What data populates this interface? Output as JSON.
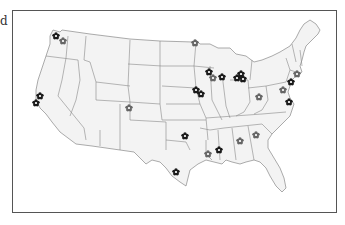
{
  "cut_label": "d",
  "map": {
    "region": "United States (contiguous)",
    "land_color": "#f3f3f3",
    "border_color": "#888888",
    "frame_color": "#555555",
    "marker_icon": "flower-icon",
    "marker_colors": {
      "dark": "#1a1a1a",
      "light": "#666666"
    },
    "markers": [
      {
        "x": 56,
        "y": 36,
        "tone": "dark"
      },
      {
        "x": 63,
        "y": 41,
        "tone": "light"
      },
      {
        "x": 195,
        "y": 43,
        "tone": "light"
      },
      {
        "x": 40,
        "y": 96,
        "tone": "dark"
      },
      {
        "x": 36,
        "y": 103,
        "tone": "dark"
      },
      {
        "x": 129,
        "y": 108,
        "tone": "light"
      },
      {
        "x": 209,
        "y": 72,
        "tone": "dark"
      },
      {
        "x": 213,
        "y": 78,
        "tone": "light"
      },
      {
        "x": 222,
        "y": 77,
        "tone": "dark"
      },
      {
        "x": 237,
        "y": 78,
        "tone": "dark"
      },
      {
        "x": 241,
        "y": 74,
        "tone": "dark"
      },
      {
        "x": 243,
        "y": 79,
        "tone": "dark"
      },
      {
        "x": 196,
        "y": 90,
        "tone": "dark"
      },
      {
        "x": 201,
        "y": 94,
        "tone": "dark"
      },
      {
        "x": 259,
        "y": 97,
        "tone": "light"
      },
      {
        "x": 297,
        "y": 74,
        "tone": "light"
      },
      {
        "x": 291,
        "y": 82,
        "tone": "dark"
      },
      {
        "x": 283,
        "y": 90,
        "tone": "light"
      },
      {
        "x": 289,
        "y": 102,
        "tone": "dark"
      },
      {
        "x": 185,
        "y": 136,
        "tone": "dark"
      },
      {
        "x": 176,
        "y": 172,
        "tone": "dark"
      },
      {
        "x": 208,
        "y": 154,
        "tone": "light"
      },
      {
        "x": 219,
        "y": 150,
        "tone": "dark"
      },
      {
        "x": 240,
        "y": 141,
        "tone": "light"
      },
      {
        "x": 256,
        "y": 135,
        "tone": "light"
      }
    ]
  }
}
